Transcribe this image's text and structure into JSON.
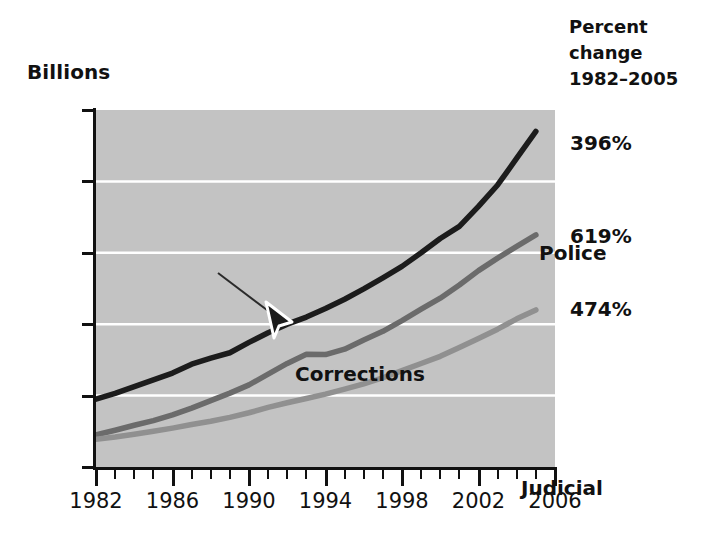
{
  "axis_unit_label": "Billions",
  "percent_header": {
    "line1": "Percent",
    "line2": "change",
    "line3": "1982–2005"
  },
  "percent_values": [
    {
      "name": "police",
      "text": "396%",
      "top": 131
    },
    {
      "name": "corrections",
      "text": "619%",
      "top": 224
    },
    {
      "name": "judicial",
      "text": "474%",
      "top": 297
    }
  ],
  "series_labels": {
    "police": "Police",
    "corrections": "Corrections",
    "judicial": "Judicial"
  },
  "chart_data": {
    "type": "line",
    "title": "",
    "xlabel": "",
    "ylabel": "Billions",
    "xlim": [
      1982,
      2006
    ],
    "ylim": [
      0,
      100
    ],
    "grid": true,
    "gridlines_y": [
      20,
      40,
      60,
      80
    ],
    "ytick_values": [
      0,
      20,
      40,
      60,
      80,
      100
    ],
    "ytick_labels": [
      "$0",
      "$20",
      "$40",
      "$60",
      "$80",
      "$100"
    ],
    "xtick_major_values": [
      1982,
      1986,
      1990,
      1994,
      1998,
      2002,
      2006
    ],
    "xtick_major_labels": [
      "1982",
      "1986",
      "1990",
      "1994",
      "1998",
      "2002",
      "2006"
    ],
    "xtick_minor_values": [
      1983,
      1984,
      1985,
      1987,
      1988,
      1989,
      1991,
      1992,
      1993,
      1995,
      1996,
      1997,
      1999,
      2000,
      2001,
      2003,
      2004,
      2005
    ],
    "legend_position": "inline-annotations",
    "x": [
      1982,
      1983,
      1984,
      1985,
      1986,
      1987,
      1988,
      1989,
      1990,
      1991,
      1992,
      1993,
      1994,
      1995,
      1996,
      1997,
      1998,
      1999,
      2000,
      2001,
      2002,
      2003,
      2004,
      2005
    ],
    "series": [
      {
        "name": "Police",
        "color": "#1c1c1c",
        "percent_change": "396%",
        "values": [
          19.0,
          20.6,
          22.5,
          24.4,
          26.3,
          28.8,
          30.5,
          32.0,
          34.9,
          37.6,
          40.0,
          42.0,
          44.4,
          47.0,
          49.9,
          53.0,
          56.2,
          60.0,
          64.0,
          67.4,
          73.0,
          79.0,
          86.5,
          94.0
        ]
      },
      {
        "name": "Corrections",
        "color": "#6b6b6b",
        "percent_change": "619%",
        "values": [
          9.0,
          10.3,
          11.7,
          13.0,
          14.6,
          16.5,
          18.6,
          20.7,
          23.0,
          26.0,
          29.0,
          31.6,
          31.5,
          33.0,
          35.6,
          38.0,
          41.0,
          44.2,
          47.3,
          51.0,
          55.0,
          58.5,
          61.8,
          65.0
        ]
      },
      {
        "name": "Judicial",
        "color": "#909090",
        "percent_change": "474%",
        "values": [
          7.8,
          8.4,
          9.2,
          10.0,
          10.9,
          11.9,
          12.8,
          13.9,
          15.2,
          16.7,
          18.0,
          19.2,
          20.4,
          21.8,
          23.3,
          25.0,
          27.0,
          29.0,
          31.0,
          33.5,
          36.0,
          38.6,
          41.5,
          44.0
        ]
      }
    ]
  }
}
